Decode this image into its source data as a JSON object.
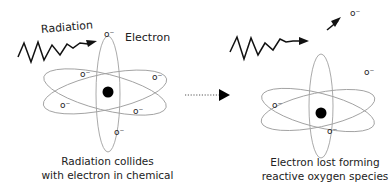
{
  "left_panel": {
    "radiation_label": "Radiation",
    "electron_label": "Electron",
    "caption_line1": "Radiation collides",
    "caption_line2": "with electron in chemical",
    "electron_symbol": "o⁻"
  },
  "right_panel": {
    "ejected_electron_symbol": "o⁻",
    "caption_line1": "Electron lost forming",
    "caption_line2": "reactive oxygen species"
  },
  "transition_arrow": {
    "style": "dotted",
    "direction": "right"
  },
  "colors": {
    "orbit": "#9a9a9a",
    "nucleus": "#000000",
    "text": "#222222",
    "arrow": "#111111"
  }
}
